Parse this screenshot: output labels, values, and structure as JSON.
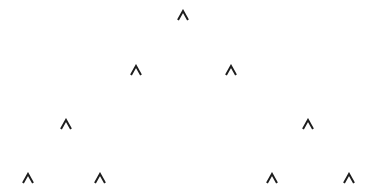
{
  "diagram": {
    "type": "binary-tree",
    "glyph": "^",
    "glyph_color": "#1e1e1e",
    "background": "#ffffff",
    "nodes": [
      {
        "id": "n0",
        "level": 0,
        "x": 183,
        "y": 15,
        "label": "^"
      },
      {
        "id": "n1",
        "level": 1,
        "x": 136,
        "y": 70,
        "label": "^"
      },
      {
        "id": "n2",
        "level": 1,
        "x": 231,
        "y": 70,
        "label": "^"
      },
      {
        "id": "n3",
        "level": 2,
        "x": 66,
        "y": 124,
        "label": "^"
      },
      {
        "id": "n4",
        "level": 2,
        "x": 308,
        "y": 124,
        "label": "^"
      },
      {
        "id": "n5",
        "level": 3,
        "x": 28,
        "y": 178,
        "label": "^"
      },
      {
        "id": "n6",
        "level": 3,
        "x": 100,
        "y": 178,
        "label": "^"
      },
      {
        "id": "n7",
        "level": 3,
        "x": 272,
        "y": 178,
        "label": "^"
      },
      {
        "id": "n8",
        "level": 3,
        "x": 349,
        "y": 178,
        "label": "^"
      }
    ]
  }
}
